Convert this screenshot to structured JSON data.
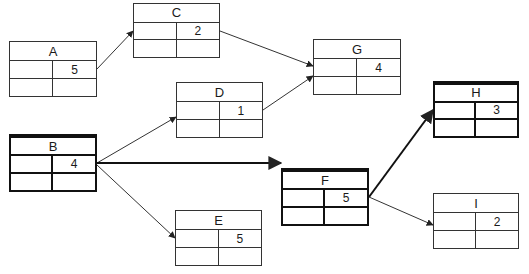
{
  "diagram": {
    "type": "activity-on-node network",
    "nodes": [
      {
        "id": "A",
        "label": "A",
        "duration": "5",
        "x": 9,
        "y": 41,
        "w": 88,
        "h": 56,
        "bold": false
      },
      {
        "id": "B",
        "label": "B",
        "duration": "4",
        "x": 9,
        "y": 134,
        "w": 88,
        "h": 58,
        "bold": true
      },
      {
        "id": "C",
        "label": "C",
        "duration": "2",
        "x": 133,
        "y": 3,
        "w": 87,
        "h": 55,
        "bold": false
      },
      {
        "id": "D",
        "label": "D",
        "duration": "1",
        "x": 176,
        "y": 82,
        "w": 87,
        "h": 56,
        "bold": false
      },
      {
        "id": "E",
        "label": "E",
        "duration": "5",
        "x": 175,
        "y": 210,
        "w": 87,
        "h": 56,
        "bold": false
      },
      {
        "id": "F",
        "label": "F",
        "duration": "5",
        "x": 281,
        "y": 168,
        "w": 88,
        "h": 58,
        "bold": true
      },
      {
        "id": "G",
        "label": "G",
        "duration": "4",
        "x": 313,
        "y": 39,
        "w": 88,
        "h": 56,
        "bold": false
      },
      {
        "id": "H",
        "label": "H",
        "duration": "3",
        "x": 433,
        "y": 81,
        "w": 86,
        "h": 57,
        "bold": true
      },
      {
        "id": "I",
        "label": "I",
        "duration": "2",
        "x": 433,
        "y": 193,
        "w": 86,
        "h": 56,
        "bold": false
      }
    ],
    "edges": [
      {
        "from": "A",
        "to": "C",
        "bold": false,
        "x1": 97,
        "y1": 69,
        "x2": 133,
        "y2": 31
      },
      {
        "from": "C",
        "to": "G",
        "bold": false,
        "x1": 220,
        "y1": 31,
        "x2": 313,
        "y2": 66
      },
      {
        "from": "D",
        "to": "G",
        "bold": false,
        "x1": 263,
        "y1": 110,
        "x2": 313,
        "y2": 76
      },
      {
        "from": "B",
        "to": "D",
        "bold": false,
        "x1": 97,
        "y1": 163,
        "x2": 176,
        "y2": 117
      },
      {
        "from": "B",
        "to": "F",
        "bold": true,
        "x1": 97,
        "y1": 163,
        "x2": 281,
        "y2": 163
      },
      {
        "from": "B",
        "to": "E",
        "bold": false,
        "x1": 97,
        "y1": 165,
        "x2": 175,
        "y2": 238
      },
      {
        "from": "F",
        "to": "H",
        "bold": true,
        "x1": 369,
        "y1": 197,
        "x2": 433,
        "y2": 110
      },
      {
        "from": "F",
        "to": "I",
        "bold": false,
        "x1": 369,
        "y1": 197,
        "x2": 433,
        "y2": 225
      }
    ],
    "critical_path": [
      "B",
      "F",
      "H"
    ],
    "colors": {
      "line": "#333333",
      "critical_line": "#111111",
      "background": "#ffffff"
    }
  }
}
